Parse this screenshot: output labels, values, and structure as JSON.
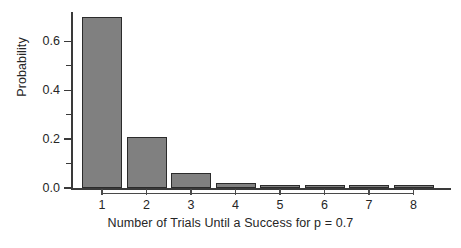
{
  "chart_data": {
    "type": "bar",
    "title": "",
    "xlabel": "Number of Trials Until a Success for p = 0.7",
    "ylabel": "Probability",
    "categories": [
      "1",
      "2",
      "3",
      "4",
      "5",
      "6",
      "7",
      "8"
    ],
    "values": [
      0.7,
      0.21,
      0.063,
      0.0189,
      0.00567,
      0.0017,
      0.00051,
      0.00015
    ],
    "series": [
      {
        "name": "Geometric p = 0.7",
        "values": [
          0.7,
          0.21,
          0.063,
          0.0189,
          0.00567,
          0.0017,
          0.00051,
          0.00015
        ]
      }
    ],
    "xlim": [
      0.5,
      8.5
    ],
    "ylim": [
      0.0,
      0.72
    ],
    "ytick_labels": [
      "0.0",
      "0.2",
      "0.4",
      "0.6"
    ],
    "ytick_values": [
      0.0,
      0.2,
      0.4,
      0.6
    ],
    "yminor_tick_values": [
      0.1,
      0.3,
      0.5
    ],
    "xtick_labels": [
      "1",
      "2",
      "3",
      "4",
      "5",
      "6",
      "7",
      "8"
    ],
    "grid": false,
    "legend": "none",
    "bar_fill_color": "#808080",
    "bar_edge_color": "#2b2b2b",
    "axis_color": "#3a3a3a",
    "background_color": "#ffffff"
  }
}
